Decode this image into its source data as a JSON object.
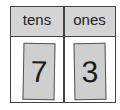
{
  "place_value_chart": {
    "headers": [
      "tens",
      "ones"
    ],
    "digits": [
      "7",
      "3"
    ],
    "colors": {
      "header_bg": "#d4d4d4",
      "card_bg": "#cfcfcf",
      "border": "#444444"
    }
  }
}
